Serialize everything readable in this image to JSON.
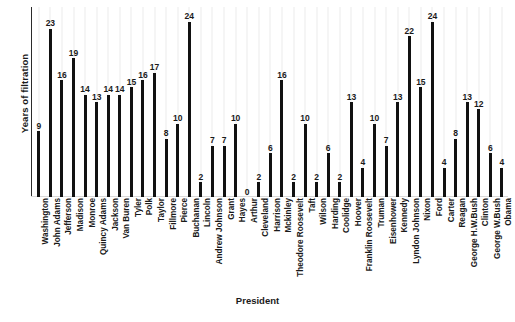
{
  "chart_data": {
    "type": "bar",
    "title": "",
    "xlabel": "President",
    "ylabel": "Years of filtration",
    "ylim": [
      0,
      26
    ],
    "grid": "vertical-category-gridlines",
    "legend": "none",
    "bar_color": "#111111",
    "categories": [
      "Washington",
      "John Adams",
      "Jefferson",
      "Madison",
      "Monroe",
      "Quincy Adams",
      "Jackson",
      "Van Buren",
      "Tyler",
      "Polk",
      "Taylor",
      "Fillmore",
      "Pierce",
      "Buchanan",
      "Lincoln",
      "Andrew Johnson",
      "Grant",
      "Hayes",
      "Arthur",
      "Cleveland",
      "Harrison",
      "Mckinley",
      "Theodore Roosevelt",
      "Taft",
      "Wilson",
      "Harding",
      "Coolidge",
      "Hoover",
      "Franklin Roosevelt",
      "Truman",
      "Eisenhower",
      "Kennedy",
      "Lyndon Johnson",
      "Nixon",
      "Ford",
      "Carter",
      "Reagan",
      "George H.W.Bush",
      "Clinton",
      "George W.Bush",
      "Obama"
    ],
    "values": [
      9,
      23,
      16,
      19,
      14,
      13,
      14,
      14,
      15,
      16,
      17,
      8,
      10,
      24,
      2,
      7,
      7,
      10,
      0,
      2,
      6,
      16,
      2,
      10,
      2,
      6,
      2,
      13,
      4,
      10,
      7,
      13,
      22,
      15,
      24,
      4,
      8,
      13,
      12,
      6,
      4
    ]
  }
}
